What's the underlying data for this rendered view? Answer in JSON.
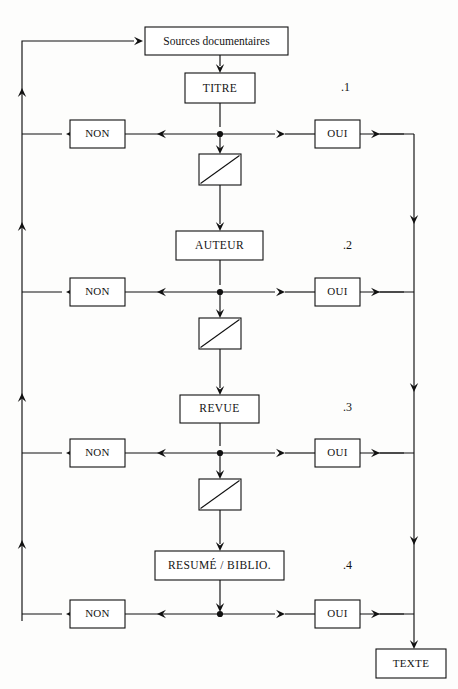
{
  "diagram": {
    "title": "Sources documentaires",
    "source_node": {
      "label": "Sources documentaires"
    },
    "terminal_node": {
      "label": "TEXTE"
    },
    "branch_labels": {
      "yes": "OUI",
      "no": "NON"
    },
    "stages": [
      {
        "number": ".1",
        "label": "TITRE",
        "yes": "OUI",
        "no": "NON"
      },
      {
        "number": ".2",
        "label": "AUTEUR",
        "yes": "OUI",
        "no": "NON"
      },
      {
        "number": ".3",
        "label": "REVUE",
        "yes": "OUI",
        "no": "NON"
      },
      {
        "number": ".4",
        "label": "RESUMÉ / BIBLIO.",
        "yes": "OUI",
        "no": "NON"
      }
    ],
    "filters": [
      {
        "name": "filter-1"
      },
      {
        "name": "filter-2"
      },
      {
        "name": "filter-3"
      }
    ],
    "colors": {
      "line": "#111111",
      "box_fill": "#ffffff",
      "text": "#141414",
      "background": "#fdfdfc"
    }
  }
}
